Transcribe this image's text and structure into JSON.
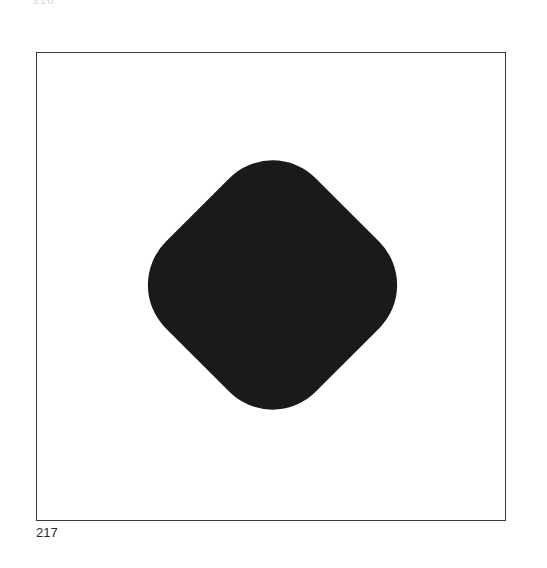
{
  "page": {
    "header_fragment": "216",
    "plate_number": "217"
  },
  "figure": {
    "shape": "rounded-diamond",
    "fill_color": "#1a1a1a",
    "frame_color": "#3a3a3a",
    "background_color": "#ffffff"
  }
}
